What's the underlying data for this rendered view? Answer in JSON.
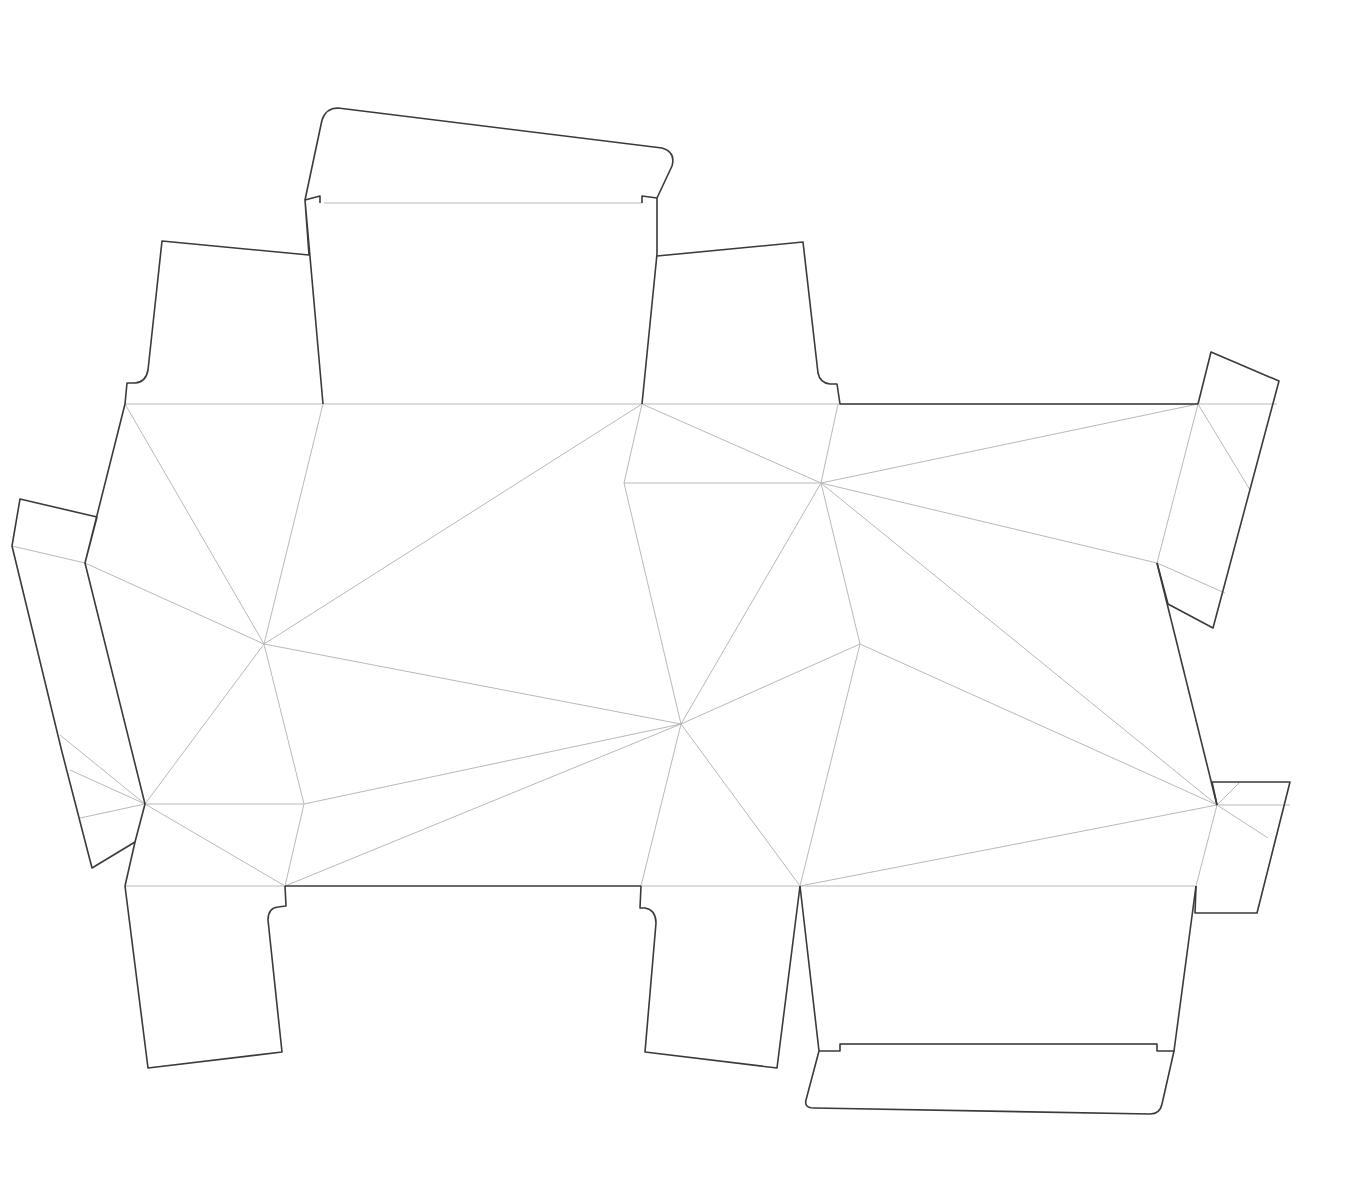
{
  "diagram": {
    "background": "#ffffff",
    "cut_color": "#3a3a3a",
    "fold_color": "#b9b9b9",
    "cut_paths": [
      {
        "name": "top-lid-flap",
        "d": "M305,200 L322,120 Q326,108 338,108 L662,148 Q676,152 672,166 L657,198 L657,254 L642,404"
      },
      {
        "name": "top-lid-tuck-left",
        "d": "M305,200 L320,196 L320,203"
      },
      {
        "name": "top-lid-tuck-right",
        "d": "M642,203 L642,196 L657,198"
      },
      {
        "name": "left-dust-flap",
        "d": "M323,404 L305,200 L309,255 L162,241 L148,370 Q146,382 135,383 L127,383 L125,404"
      },
      {
        "name": "right-dust-flap",
        "d": "M657,256 L803,242 L818,373 Q820,383 830,384 L837,384 L840,404 L1198,404"
      },
      {
        "name": "right-top-flap",
        "d": "M1198,404 L1211,352 L1279,381 L1213,628 L1168,604 L1157,563"
      },
      {
        "name": "right-side-edge",
        "d": "M1157,563 L1217,805"
      },
      {
        "name": "right-bottom-flap",
        "d": "M1212,782 L1290,782 L1257,913 L1195,913 L1196,886"
      },
      {
        "name": "right-bottom-edge",
        "d": "M1217,805 L1212,782"
      },
      {
        "name": "bottom-lid-panel",
        "d": "M800,886 L819,1051 L840,1051 L840,1044 L1157,1044 L1157,1051 L1174,1051 L1196,886"
      },
      {
        "name": "bottom-lid-flap",
        "d": "M819,1051 L806,1100 Q804,1108 814,1108 L1150,1114 Q1160,1114 1162,1104 L1174,1051"
      },
      {
        "name": "bottom-center-flap",
        "d": "M800,886 L777,1068 L645,1052 L656,923 Q656,910 645,908 L640,908 L641,886"
      },
      {
        "name": "bottom-edge",
        "d": "M285,886 L641,886"
      },
      {
        "name": "bottom-left-flap",
        "d": "M285,886 L286,906 L278,907 Q268,908 268,920 L282,1052 L148,1068 L125,886"
      },
      {
        "name": "left-lower-edge",
        "d": "M125,886 L135,842 L92,868 L62,752 L12,546 L20,499 L97,517 L85,563 L125,404"
      },
      {
        "name": "left-side-edge",
        "d": "M85,563 L145,804 L135,842"
      }
    ],
    "fold_lines": [
      [
        125,
        404,
        323,
        404
      ],
      [
        323,
        404,
        642,
        404
      ],
      [
        642,
        404,
        838,
        404
      ],
      [
        838,
        404,
        1198,
        404
      ],
      [
        1198,
        404,
        1277,
        404
      ],
      [
        125,
        404,
        264,
        644
      ],
      [
        323,
        404,
        264,
        644
      ],
      [
        642,
        404,
        264,
        644
      ],
      [
        642,
        404,
        624,
        483
      ],
      [
        642,
        404,
        821,
        483
      ],
      [
        838,
        404,
        821,
        483
      ],
      [
        1198,
        404,
        821,
        483
      ],
      [
        624,
        483,
        821,
        483
      ],
      [
        624,
        483,
        681,
        724
      ],
      [
        821,
        483,
        681,
        724
      ],
      [
        821,
        483,
        860,
        644
      ],
      [
        821,
        483,
        1217,
        805
      ],
      [
        821,
        483,
        1157,
        563
      ],
      [
        1198,
        404,
        1157,
        563
      ],
      [
        1198,
        404,
        1250,
        490
      ],
      [
        1157,
        563,
        1225,
        593
      ],
      [
        85,
        563,
        264,
        644
      ],
      [
        12,
        546,
        85,
        563
      ],
      [
        264,
        644,
        681,
        724
      ],
      [
        264,
        644,
        145,
        804
      ],
      [
        264,
        644,
        304,
        804
      ],
      [
        145,
        804,
        304,
        804
      ],
      [
        304,
        804,
        681,
        724
      ],
      [
        304,
        804,
        285,
        886
      ],
      [
        145,
        804,
        285,
        886
      ],
      [
        285,
        886,
        681,
        724
      ],
      [
        145,
        804,
        60,
        735
      ],
      [
        145,
        804,
        70,
        770
      ],
      [
        145,
        804,
        80,
        818
      ],
      [
        681,
        724,
        860,
        644
      ],
      [
        681,
        724,
        641,
        886
      ],
      [
        681,
        724,
        800,
        886
      ],
      [
        860,
        644,
        1217,
        805
      ],
      [
        860,
        644,
        800,
        886
      ],
      [
        800,
        886,
        1217,
        805
      ],
      [
        1217,
        805,
        1196,
        886
      ],
      [
        1217,
        805,
        1290,
        805
      ],
      [
        1217,
        805,
        1240,
        782
      ],
      [
        1217,
        805,
        1268,
        838
      ],
      [
        125,
        886,
        285,
        886
      ],
      [
        641,
        886,
        800,
        886
      ],
      [
        800,
        886,
        1196,
        886
      ],
      [
        324,
        203,
        642,
        203
      ],
      [
        840,
        1044,
        1157,
        1044
      ]
    ]
  }
}
